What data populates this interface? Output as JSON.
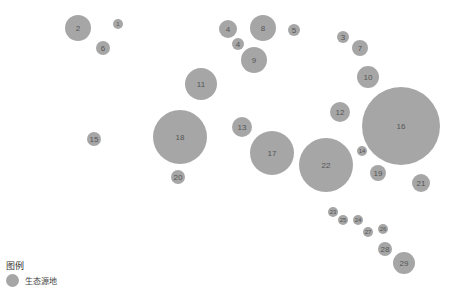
{
  "colors": {
    "node": "#a6a6a6",
    "label": "#555555",
    "background": "#ffffff"
  },
  "legend": {
    "title": "图例",
    "items": [
      {
        "label": "生态源地",
        "icon": "circle-swatch"
      }
    ]
  },
  "nodes": [
    {
      "id": "1",
      "x": 118,
      "y": 24,
      "r": 5
    },
    {
      "id": "2",
      "x": 78,
      "y": 28,
      "r": 13
    },
    {
      "id": "6",
      "x": 103,
      "y": 48,
      "r": 7
    },
    {
      "id": "4",
      "x": 228,
      "y": 29,
      "r": 9
    },
    {
      "id": "4",
      "x": 238,
      "y": 44,
      "r": 6
    },
    {
      "id": "8",
      "x": 263,
      "y": 28,
      "r": 13
    },
    {
      "id": "5",
      "x": 294,
      "y": 30,
      "r": 6
    },
    {
      "id": "9",
      "x": 254,
      "y": 60,
      "r": 13
    },
    {
      "id": "3",
      "x": 343,
      "y": 37,
      "r": 6
    },
    {
      "id": "7",
      "x": 360,
      "y": 48,
      "r": 8
    },
    {
      "id": "10",
      "x": 368,
      "y": 77,
      "r": 11
    },
    {
      "id": "11",
      "x": 201,
      "y": 84,
      "r": 16
    },
    {
      "id": "12",
      "x": 340,
      "y": 112,
      "r": 10
    },
    {
      "id": "16",
      "x": 401,
      "y": 126,
      "r": 39
    },
    {
      "id": "13",
      "x": 242,
      "y": 127,
      "r": 10
    },
    {
      "id": "15",
      "x": 94,
      "y": 139,
      "r": 7
    },
    {
      "id": "18",
      "x": 180,
      "y": 137,
      "r": 27
    },
    {
      "id": "17",
      "x": 272,
      "y": 153,
      "r": 22
    },
    {
      "id": "22",
      "x": 326,
      "y": 165,
      "r": 27
    },
    {
      "id": "14",
      "x": 362,
      "y": 151,
      "r": 5
    },
    {
      "id": "19",
      "x": 378,
      "y": 173,
      "r": 8
    },
    {
      "id": "21",
      "x": 421,
      "y": 183,
      "r": 9
    },
    {
      "id": "20",
      "x": 178,
      "y": 177,
      "r": 7
    },
    {
      "id": "23",
      "x": 333,
      "y": 212,
      "r": 5
    },
    {
      "id": "25",
      "x": 343,
      "y": 220,
      "r": 5
    },
    {
      "id": "24",
      "x": 358,
      "y": 220,
      "r": 5
    },
    {
      "id": "27",
      "x": 368,
      "y": 232,
      "r": 5
    },
    {
      "id": "26",
      "x": 383,
      "y": 229,
      "r": 5
    },
    {
      "id": "28",
      "x": 385,
      "y": 249,
      "r": 7
    },
    {
      "id": "29",
      "x": 404,
      "y": 263,
      "r": 11
    }
  ]
}
